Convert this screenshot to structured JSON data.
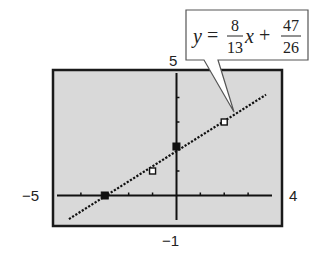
{
  "chart_data": {
    "type": "scatter",
    "title": "",
    "xlabel": "",
    "ylabel": "",
    "window": {
      "xmin": -5,
      "xmax": 4,
      "ymin": -1,
      "ymax": 5,
      "xscl": 1,
      "yscl": 1
    },
    "xlim": [
      -5,
      4
    ],
    "ylim": [
      -1,
      5
    ],
    "grid": false,
    "legend": null,
    "tick_labels": {
      "x_min": "−5",
      "x_max": "4",
      "y_min": "−1",
      "y_max": "5"
    },
    "series": [
      {
        "name": "data points (filled)",
        "marker": "filled-square",
        "points": [
          {
            "x": -3,
            "y": 0
          },
          {
            "x": 0,
            "y": 2
          }
        ]
      },
      {
        "name": "data points (open)",
        "marker": "open-square",
        "points": [
          {
            "x": -1,
            "y": 1
          },
          {
            "x": 2,
            "y": 3
          }
        ]
      },
      {
        "name": "regression line",
        "type": "line",
        "style": "dotted",
        "slope": 0.6153846,
        "intercept": 1.8076923,
        "x_range": [
          -4.5,
          3.75
        ]
      }
    ],
    "annotation": {
      "text": "y = 8/13 x + 47/26",
      "lhs": "y",
      "slope_num": "8",
      "slope_den": "13",
      "var": "x",
      "op": "+",
      "int_num": "47",
      "int_den": "26"
    }
  },
  "colors": {
    "screen_bg": "#d9d9d9",
    "frame": "#1a1a1a",
    "ink": "#222222",
    "page_bg": "#ffffff"
  }
}
